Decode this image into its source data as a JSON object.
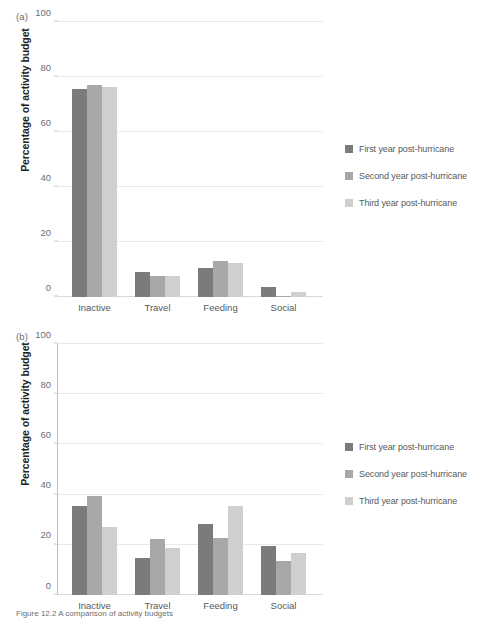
{
  "figure": {
    "caption": "Figure 12.2 A comparison of activity budgets"
  },
  "panels": [
    {
      "tag": "(a)",
      "ylabel": "Percentage of activity budget",
      "yticks": [
        "0",
        "20",
        "40",
        "60",
        "80",
        "100"
      ]
    },
    {
      "tag": "(b)",
      "ylabel": "Percentage of activity budget",
      "yticks": [
        "0",
        "20",
        "40",
        "60",
        "80",
        "100"
      ]
    }
  ],
  "legend": {
    "items": [
      {
        "label": "First year post-hurricane",
        "color": "#7b7b7b"
      },
      {
        "label": "Second year post-hurricane",
        "color": "#a8a8a8"
      },
      {
        "label": "Third year post-hurricane",
        "color": "#cfcfcf"
      }
    ]
  },
  "chart_data": [
    {
      "type": "bar",
      "panel": "(a)",
      "title": "",
      "xlabel": "",
      "ylabel": "Percentage of activity budget",
      "ylim": [
        0,
        100
      ],
      "yticks": [
        0,
        20,
        40,
        60,
        80,
        100
      ],
      "grid": true,
      "legend_position": "right",
      "categories": [
        "Inactive",
        "Travel",
        "Feeding",
        "Social"
      ],
      "series": [
        {
          "name": "First year post-hurricane",
          "color": "#7b7b7b",
          "values": [
            75.5,
            9.0,
            10.5,
            3.5
          ]
        },
        {
          "name": "Second year post-hurricane",
          "color": "#a8a8a8",
          "values": [
            77.0,
            7.8,
            13.0,
            0.5
          ]
        },
        {
          "name": "Third year post-hurricane",
          "color": "#cfcfcf",
          "values": [
            76.3,
            7.8,
            12.5,
            2.0
          ]
        }
      ]
    },
    {
      "type": "bar",
      "panel": "(b)",
      "title": "",
      "xlabel": "",
      "ylabel": "Percentage of activity budget",
      "ylim": [
        0,
        100
      ],
      "yticks": [
        0,
        20,
        40,
        60,
        80,
        100
      ],
      "grid": true,
      "legend_position": "right",
      "categories": [
        "Inactive",
        "Travel",
        "Feeding",
        "Social"
      ],
      "series": [
        {
          "name": "First year post-hurricane",
          "color": "#7b7b7b",
          "values": [
            35.3,
            14.8,
            28.2,
            19.7
          ]
        },
        {
          "name": "Second year post-hurricane",
          "color": "#a8a8a8",
          "values": [
            39.3,
            22.3,
            22.8,
            13.7
          ]
        },
        {
          "name": "Third year post-hurricane",
          "color": "#cfcfcf",
          "values": [
            27.2,
            18.8,
            35.3,
            16.8
          ]
        }
      ]
    }
  ]
}
